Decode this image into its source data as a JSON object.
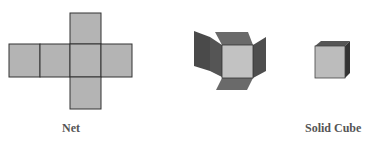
{
  "figures": [
    {
      "id": "net",
      "label": "Net"
    },
    {
      "id": "folding",
      "label": ""
    },
    {
      "id": "solid",
      "label": "Solid Cube"
    }
  ],
  "colors": {
    "face": "#b4b4b4",
    "edge": "#333333",
    "dark_face": "#4a4a4a",
    "mid_face": "#6a6a6a",
    "light_face": "#c2c2c2",
    "label": "#555555"
  }
}
